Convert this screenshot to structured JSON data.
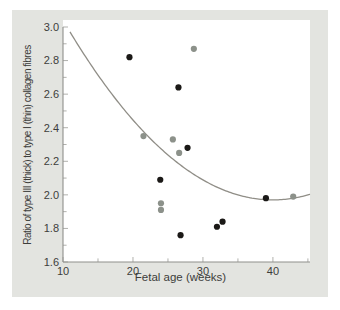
{
  "figure": {
    "panel_bg": "#e3e4e0",
    "plot_bg": "#ffffff",
    "axis_color": "#8f8f8b",
    "tick_color": "#b1b1ad",
    "text_color": "#3d3d3b",
    "curve_color": "#908e87",
    "series_colors": {
      "black": "#1b1917",
      "gray": "#8c918a"
    }
  },
  "chart_data": {
    "type": "scatter",
    "title": "",
    "xlabel": "Fetal age (weeks)",
    "ylabel": "Ratio of type III (thick) to type I (thin) collagen fibres",
    "xlim": [
      10,
      45.3
    ],
    "ylim": [
      1.6,
      3.0
    ],
    "x_major_ticks": [
      10,
      20,
      30,
      40
    ],
    "x_minor_ticks": [
      15,
      25,
      35,
      45
    ],
    "y_major_ticks": [
      1.6,
      1.8,
      2.0,
      2.2,
      2.4,
      2.6,
      2.8,
      3.0
    ],
    "y_minor_ticks": [
      1.7,
      1.9,
      2.1,
      2.3,
      2.5,
      2.7,
      2.9
    ],
    "grid": false,
    "legend": "none",
    "series": [
      {
        "name": "black-points",
        "color_key": "black",
        "points": [
          [
            19.5,
            2.82
          ],
          [
            26.5,
            2.64
          ],
          [
            27.8,
            2.28
          ],
          [
            23.9,
            2.09
          ],
          [
            26.8,
            1.76
          ],
          [
            32.0,
            1.81
          ],
          [
            32.8,
            1.84
          ],
          [
            39.0,
            1.98
          ]
        ]
      },
      {
        "name": "gray-points",
        "color_key": "gray",
        "points": [
          [
            28.7,
            2.87
          ],
          [
            21.5,
            2.35
          ],
          [
            25.7,
            2.33
          ],
          [
            26.6,
            2.25
          ],
          [
            24.0,
            1.95
          ],
          [
            24.0,
            1.91
          ],
          [
            42.9,
            1.99
          ]
        ]
      }
    ],
    "trend_curve": {
      "type": "quadratic",
      "equation": "y = 1.97 + 0.00119*(x-40)^2",
      "a": 0.00119,
      "vertex_x": 40,
      "vertex_y": 1.97,
      "x_start": 11,
      "x_end": 45.3
    }
  }
}
